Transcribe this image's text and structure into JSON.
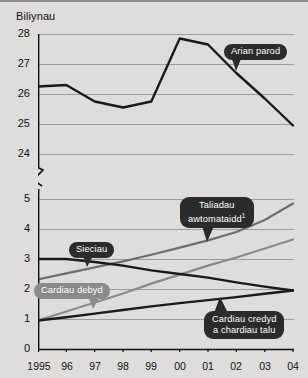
{
  "chart_data": {
    "type": "line",
    "title": "Biliynau",
    "xlabel": "",
    "ylabel": "Biliynau",
    "grid": true,
    "legend_position": "inline-callouts",
    "axis_break": true,
    "x": [
      "1995",
      "96",
      "97",
      "98",
      "99",
      "00",
      "01",
      "02",
      "03",
      "04"
    ],
    "x_tick_labels": [
      "1995",
      "96",
      "97",
      "98",
      "99",
      "00",
      "01",
      "02",
      "03",
      "04"
    ],
    "upper_panel": {
      "ylim": [
        24,
        28
      ],
      "y_ticks": [
        24,
        25,
        26,
        27,
        28
      ],
      "series": [
        {
          "name": "Arian parod",
          "color": "#1a1a1a",
          "values": [
            26.25,
            26.3,
            25.75,
            25.55,
            25.75,
            27.85,
            27.65,
            26.7,
            25.85,
            24.95
          ]
        }
      ]
    },
    "lower_panel": {
      "ylim": [
        0,
        5
      ],
      "y_ticks": [
        0,
        1,
        2,
        3,
        4,
        5
      ],
      "series": [
        {
          "name": "Sieciau",
          "color": "#1a1a1a",
          "values": [
            3.0,
            3.0,
            2.9,
            2.78,
            2.62,
            2.5,
            2.38,
            2.22,
            2.08,
            1.95
          ]
        },
        {
          "name": "Taliadau awtomataidd",
          "footnote": "1",
          "color": "#6e6e6c",
          "values": [
            2.32,
            2.52,
            2.72,
            2.92,
            3.14,
            3.38,
            3.62,
            3.9,
            4.3,
            4.85
          ]
        },
        {
          "name": "Cardiau debyd",
          "color": "#8a8a88",
          "values": [
            0.95,
            1.25,
            1.55,
            1.85,
            2.18,
            2.48,
            2.78,
            3.05,
            3.35,
            3.65
          ]
        },
        {
          "name": "Cardiau credyd a chardiau talu",
          "color": "#1a1a1a",
          "values": [
            0.95,
            1.06,
            1.18,
            1.3,
            1.42,
            1.53,
            1.63,
            1.73,
            1.84,
            1.95
          ]
        }
      ]
    }
  },
  "callouts": {
    "cash": "Arian parod",
    "cheques": "Sieciau",
    "auto_payments": "Taliadau awtomataidd",
    "auto_payments_footnote": "1",
    "debit_cards": "Cardiau debyd",
    "credit_cards_line1": "Cardiau credyd",
    "credit_cards_line2": "a chardiau talu"
  },
  "axis": {
    "y_upper": [
      "28",
      "27",
      "26",
      "25",
      "24"
    ],
    "y_lower": [
      "5",
      "4",
      "3",
      "2",
      "1",
      "0"
    ],
    "x": [
      "1995",
      "96",
      "97",
      "98",
      "99",
      "00",
      "01",
      "02",
      "03",
      "04"
    ]
  }
}
